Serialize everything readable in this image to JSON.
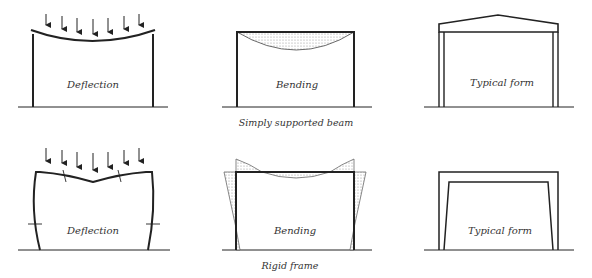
{
  "rows": [
    {
      "caption": "Simply supported beam",
      "panels": [
        {
          "id": "deflection",
          "label": "Deflection"
        },
        {
          "id": "bending",
          "label": "Bending"
        },
        {
          "id": "typical-form",
          "label": "Typical form"
        }
      ]
    },
    {
      "caption": "Rigid frame",
      "panels": [
        {
          "id": "deflection",
          "label": "Deflection"
        },
        {
          "id": "bending",
          "label": "Bending"
        },
        {
          "id": "typical-form",
          "label": "Typical form"
        }
      ]
    }
  ],
  "colors": {
    "line": "#222222",
    "hatch": "#bbbbbb",
    "background": "#ffffff"
  }
}
